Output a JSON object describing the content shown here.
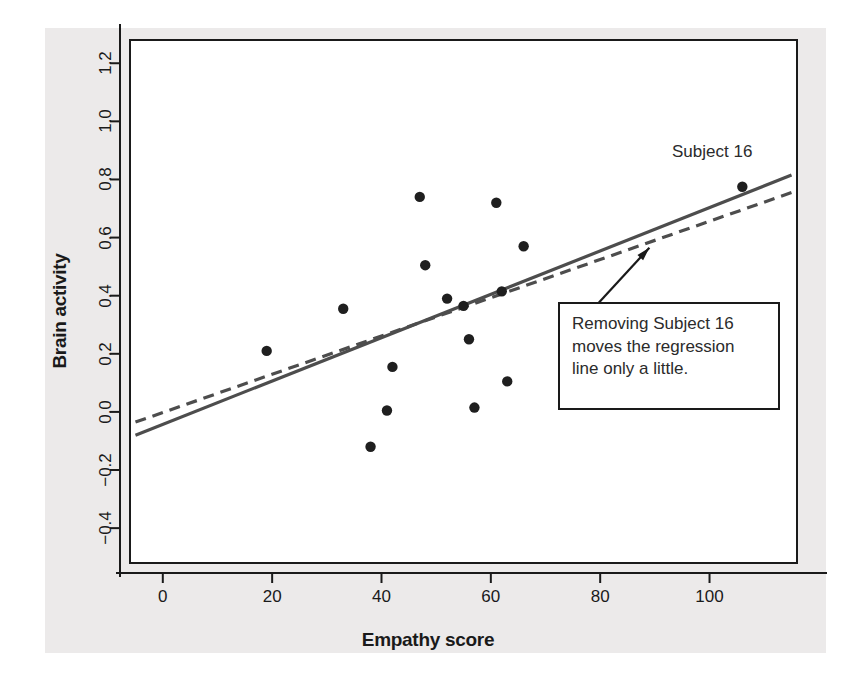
{
  "chart_data": {
    "type": "scatter",
    "title": "",
    "xlabel": "Empathy score",
    "ylabel": "Brain activity",
    "xlim": [
      -6,
      116
    ],
    "ylim": [
      -0.52,
      1.28
    ],
    "xticks": [
      0,
      20,
      40,
      60,
      80,
      100
    ],
    "xtick_labels": [
      "0",
      "20",
      "40",
      "60",
      "80",
      "100"
    ],
    "yticks": [
      -0.4,
      -0.2,
      0.0,
      0.2,
      0.4,
      0.6,
      0.8,
      1.0,
      1.2
    ],
    "ytick_labels": [
      "-0.4",
      "-0.2",
      "0.0",
      "0.2",
      "0.4",
      "0.6",
      "0.8",
      "1.0",
      "1.2"
    ],
    "grid": false,
    "legend": "none",
    "points": [
      {
        "x": 19,
        "y": 0.21
      },
      {
        "x": 33,
        "y": 0.355
      },
      {
        "x": 38,
        "y": -0.12
      },
      {
        "x": 41,
        "y": 0.005
      },
      {
        "x": 42,
        "y": 0.155
      },
      {
        "x": 47,
        "y": 0.74
      },
      {
        "x": 48,
        "y": 0.505
      },
      {
        "x": 52,
        "y": 0.39
      },
      {
        "x": 55,
        "y": 0.365
      },
      {
        "x": 56,
        "y": 0.25
      },
      {
        "x": 57,
        "y": 0.015
      },
      {
        "x": 61,
        "y": 0.72
      },
      {
        "x": 62,
        "y": 0.415
      },
      {
        "x": 63,
        "y": 0.105
      },
      {
        "x": 66,
        "y": 0.57
      },
      {
        "x": 106,
        "y": 0.775
      }
    ],
    "series": [
      {
        "name": "regression-all-data",
        "style": "solid",
        "color": "#4d4d4d",
        "endpoints": [
          {
            "x": -5,
            "y": -0.08
          },
          {
            "x": 115,
            "y": 0.815
          }
        ]
      },
      {
        "name": "regression-without-subject-16",
        "style": "dashed",
        "color": "#4d4d4d",
        "endpoints": [
          {
            "x": -5,
            "y": -0.035
          },
          {
            "x": 115,
            "y": 0.755
          }
        ]
      }
    ],
    "annotations": [
      {
        "name": "subject-16-label",
        "text": "Subject 16",
        "x": 101,
        "y": 0.905
      },
      {
        "name": "callout-box",
        "text": "Removing Subject 16 moves the regression line only a little.",
        "lines": [
          "Removing Subject 16",
          "moves the regression",
          "line only a little."
        ],
        "arrow_from": {
          "x": 77,
          "y": 0.32
        },
        "arrow_to": {
          "x": 89,
          "y": 0.565
        }
      }
    ]
  },
  "axes": {
    "x_title": "Empathy score",
    "y_title": "Brain activity"
  },
  "annotation": {
    "subject_label": "Subject 16",
    "line1": "Removing Subject 16",
    "line2": "moves the regression",
    "line3": "line only a little."
  },
  "colors": {
    "figure_background": "#eceaea",
    "panel_background": "#ffffff",
    "axis": "#1a1a1a",
    "point": "#1f1f1f",
    "regression_line": "#4d4d4d"
  }
}
